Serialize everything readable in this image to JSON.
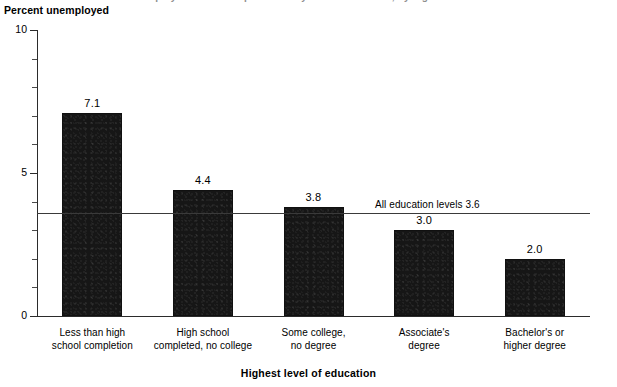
{
  "figure": {
    "clipped_top_caption": "unemployment rates of persons 25 years old and over, by highest level of education",
    "ylabel": "Percent unemployed",
    "xlabel": "Highest level of education"
  },
  "chart_data": {
    "type": "bar",
    "title": "",
    "subtitle": "",
    "xlabel": "Highest level of education",
    "ylabel": "Percent unemployed",
    "ylim": [
      0,
      10
    ],
    "ytick_labels": [
      "0",
      "5",
      "10"
    ],
    "ytick_values": [
      0,
      5,
      10
    ],
    "yminor_ticks": [
      1,
      2,
      3,
      4,
      6,
      7,
      8,
      9
    ],
    "grid": false,
    "legend": "none",
    "categories": [
      "Less than high school completion",
      "High school completed, no college",
      "Some college, no degree",
      "Associate's degree",
      "Bachelor's or higher degree"
    ],
    "category_lines": [
      [
        "Less than high",
        "school completion"
      ],
      [
        "High school",
        "completed, no college"
      ],
      [
        "Some college,",
        "no degree"
      ],
      [
        "Associate's",
        "degree"
      ],
      [
        "Bachelor's or",
        "higher degree"
      ]
    ],
    "values": [
      7.1,
      4.4,
      3.8,
      3.0,
      2.0
    ],
    "value_labels": [
      "7.1",
      "4.4",
      "3.8",
      "3.0",
      "2.0"
    ],
    "bar_color": "#161616",
    "reference_line": {
      "value": 3.6,
      "label": "All education levels 3.6",
      "color": "#3a3a3a"
    }
  },
  "colors": {
    "bar": "#161616",
    "axis": "#2b2b2b",
    "reference_line": "#3a3a3a",
    "background": "#ffffff"
  }
}
